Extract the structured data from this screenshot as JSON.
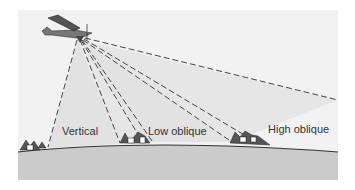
{
  "diagram": {
    "type": "aerial-photography-angles",
    "labels": {
      "vertical": "Vertical",
      "low_oblique": "Low oblique",
      "high_oblique": "High oblique"
    },
    "colors": {
      "panel": "#f1f1f1",
      "beam": "#e0e0e0",
      "ground": "#cbcbcb",
      "dash": "#444444",
      "ground_line": "#333333"
    }
  }
}
